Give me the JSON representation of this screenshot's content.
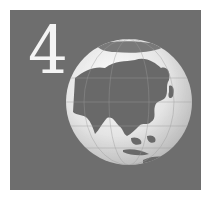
{
  "panel": {
    "numeral": "4",
    "background": "#6e6e6e",
    "numeral_color": "#f4f4f4"
  },
  "globe": {
    "label": "globe-asia",
    "ocean_color": "#e6e6e6",
    "land_color": "#6a6a6a"
  }
}
